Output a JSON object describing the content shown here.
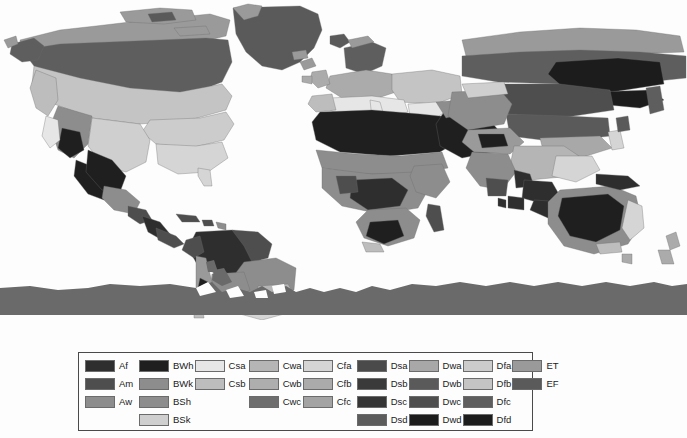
{
  "figure": {
    "background_color": "#fdfdfd"
  },
  "map": {
    "name": "world-climate-map",
    "projection": "equirectangular",
    "ocean_color": "#fdfdfd",
    "border_color": "#6b6b6b",
    "antarctica_color": "#6a6a6a",
    "regions": [
      {
        "name": "north-america",
        "label": "North America"
      },
      {
        "name": "south-america",
        "label": "South America"
      },
      {
        "name": "europe",
        "label": "Europe"
      },
      {
        "name": "africa",
        "label": "Africa"
      },
      {
        "name": "asia",
        "label": "Asia"
      },
      {
        "name": "australia",
        "label": "Australia"
      },
      {
        "name": "antarctica",
        "label": "Antarctica"
      },
      {
        "name": "greenland",
        "label": "Greenland"
      }
    ]
  },
  "legend": {
    "border_color": "#4a4a4a",
    "columns": [
      {
        "name": "group-a",
        "entries": [
          {
            "code": "Af",
            "color": "#2e2e2e"
          },
          {
            "code": "Am",
            "color": "#4e4e4e"
          },
          {
            "code": "Aw",
            "color": "#8d8d8d"
          }
        ]
      },
      {
        "name": "group-b",
        "entries": [
          {
            "code": "BWh",
            "color": "#1f1f1f"
          },
          {
            "code": "BWk",
            "color": "#8d8d8d"
          },
          {
            "code": "BSh",
            "color": "#8d8d8d"
          },
          {
            "code": "BSk",
            "color": "#cfcfcf"
          }
        ]
      },
      {
        "name": "group-cs",
        "entries": [
          {
            "code": "Csa",
            "color": "#e6e6e6"
          },
          {
            "code": "Csb",
            "color": "#bdbdbd"
          }
        ]
      },
      {
        "name": "group-cw",
        "entries": [
          {
            "code": "Cwa",
            "color": "#b5b5b5"
          },
          {
            "code": "Cwb",
            "color": "#aeaeae"
          },
          {
            "code": "Cwc",
            "color": "#6e6e6e"
          }
        ]
      },
      {
        "name": "group-cf",
        "entries": [
          {
            "code": "Cfa",
            "color": "#d5d5d5"
          },
          {
            "code": "Cfb",
            "color": "#ababab"
          },
          {
            "code": "Cfc",
            "color": "#a3a3a3"
          }
        ]
      },
      {
        "name": "group-ds",
        "entries": [
          {
            "code": "Dsa",
            "color": "#4a4a4a"
          },
          {
            "code": "Dsb",
            "color": "#3a3a3a"
          },
          {
            "code": "Dsc",
            "color": "#353535"
          },
          {
            "code": "Dsd",
            "color": "#5c5c5c"
          }
        ]
      },
      {
        "name": "group-dw",
        "entries": [
          {
            "code": "Dwa",
            "color": "#a8a8a8"
          },
          {
            "code": "Dwb",
            "color": "#5a5a5a"
          },
          {
            "code": "Dwc",
            "color": "#4e4e4e"
          },
          {
            "code": "Dwd",
            "color": "#1c1c1c"
          }
        ]
      },
      {
        "name": "group-df",
        "entries": [
          {
            "code": "Dfa",
            "color": "#cccccc"
          },
          {
            "code": "Dfb",
            "color": "#c4c4c4"
          },
          {
            "code": "Dfc",
            "color": "#5e5e5e"
          },
          {
            "code": "Dfd",
            "color": "#1c1c1c"
          }
        ]
      },
      {
        "name": "group-e",
        "entries": [
          {
            "code": "ET",
            "color": "#9a9a9a"
          },
          {
            "code": "EF",
            "color": "#5a5a5a"
          }
        ]
      }
    ]
  }
}
